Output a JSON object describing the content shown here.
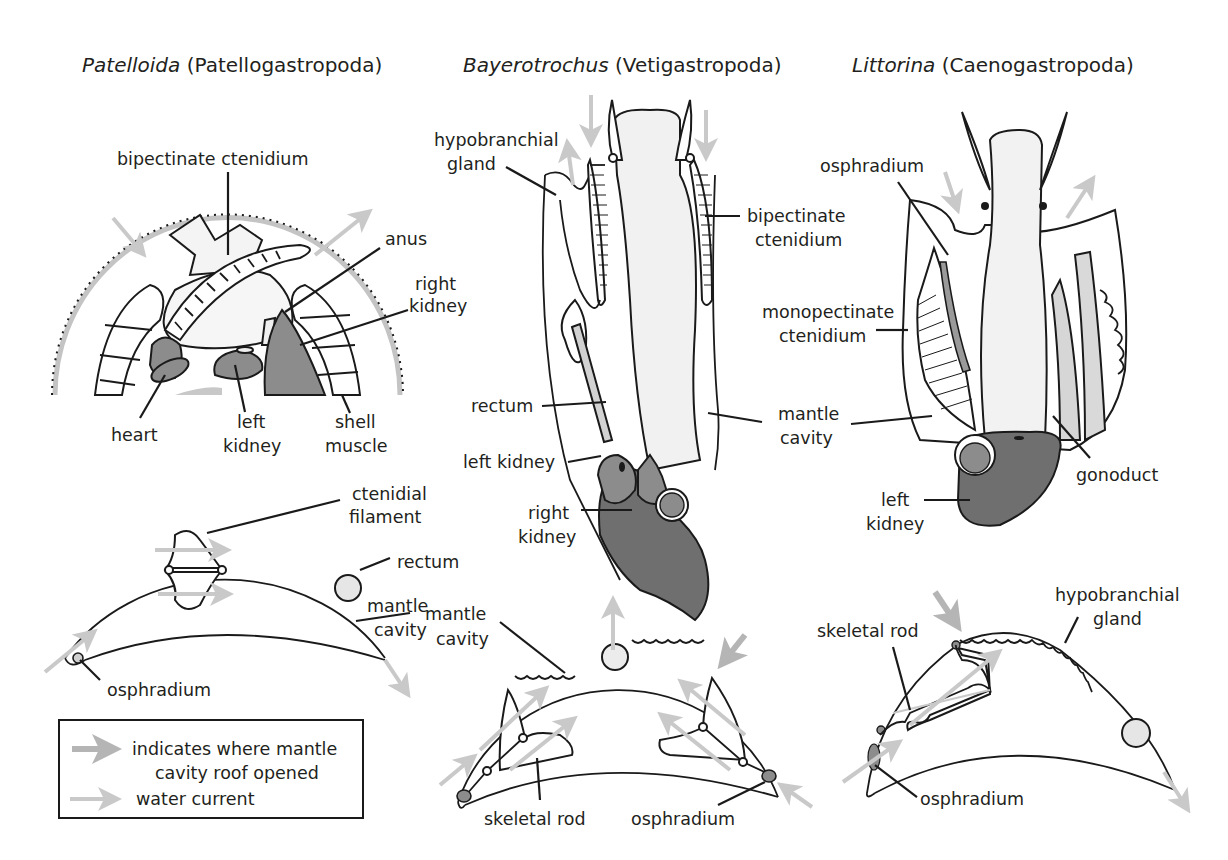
{
  "colors": {
    "outline": "#1a1a1a",
    "organ_dark": "#6f6f6f",
    "organ_mid": "#8c8c8c",
    "organ_light": "#efefef",
    "arrow_gray": "#c9c9c9",
    "arrow_dark": "#b5b5b5",
    "text": "#231f20"
  },
  "panels": {
    "patelloida": {
      "genus": "Patelloida",
      "group": "(Patellogastropoda)",
      "labels": {
        "bipectinate_ctenidium": "bipectinate ctenidium",
        "anus": "anus",
        "right_kidney_1": "right",
        "right_kidney_2": "kidney",
        "heart": "heart",
        "left_kidney_1": "left",
        "left_kidney_2": "kidney",
        "shell_muscle_1": "shell",
        "shell_muscle_2": "muscle",
        "ctenidial_filament_1": "ctenidial",
        "ctenidial_filament_2": "filament",
        "rectum": "rectum",
        "mantle_cavity_1": "mantle",
        "mantle_cavity_2": "cavity",
        "osphradium": "osphradium"
      }
    },
    "bayerotrochus": {
      "genus": "Bayerotrochus",
      "group": "(Vetigastropoda)",
      "labels": {
        "hypobranchial_gland_1": "hypobranchial",
        "hypobranchial_gland_2": "gland",
        "bipectinate_ctenidium_1": "bipectinate",
        "bipectinate_ctenidium_2": "ctenidium",
        "rectum": "rectum",
        "left_kidney": "left kidney",
        "right_kidney_1": "right",
        "right_kidney_2": "kidney",
        "mantle_cavity_1": "mantle",
        "mantle_cavity_2": "cavity",
        "mantle_cavity_x1": "mantle",
        "mantle_cavity_x2": "cavity",
        "skeletal_rod": "skeletal rod",
        "osphradium": "osphradium"
      }
    },
    "littorina": {
      "genus": "Littorina",
      "group": "(Caenogastropoda)",
      "labels": {
        "osphradium": "osphradium",
        "monopectinate_ctenidium_1": "monopectinate",
        "monopectinate_ctenidium_2": "ctenidium",
        "gonoduct": "gonoduct",
        "left_kidney_1": "left",
        "left_kidney_2": "kidney",
        "hypobranchial_gland_1": "hypobranchial",
        "hypobranchial_gland_2": "gland",
        "skeletal_rod": "skeletal rod",
        "osphradium_x": "osphradium"
      }
    }
  },
  "legend": {
    "mantle_opened_1": "indicates where mantle",
    "mantle_opened_2": "cavity roof opened",
    "water_current": "water current"
  }
}
